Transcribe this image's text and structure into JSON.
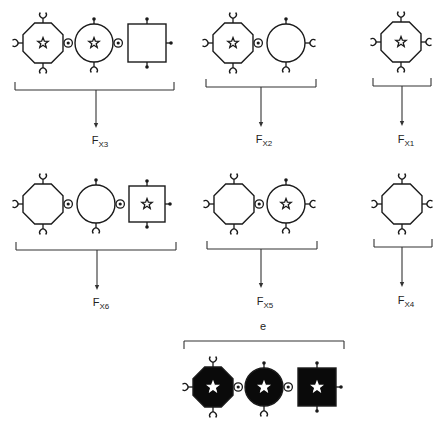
{
  "colors": {
    "stroke": "#1a1a1a",
    "fill_dark": "#0a0a0a",
    "star_light": "#ffffff",
    "background": "#ffffff"
  },
  "groups": [
    {
      "id": "x3",
      "label_main": "F",
      "label_sub": "X3",
      "bracket": {
        "x1": 15,
        "x2": 174,
        "y": 90,
        "arrow_x": 96,
        "arrow_y2": 128
      },
      "label_pos": {
        "x": 100,
        "y": 134
      },
      "shapes": [
        {
          "type": "octagon",
          "cx": 43,
          "cy": 43,
          "r": 20,
          "star": true,
          "filled": false,
          "ports": {
            "top": "cup",
            "bottom": "cup",
            "left": "cup",
            "right": "socket"
          }
        },
        {
          "type": "circle",
          "cx": 94,
          "cy": 43,
          "r": 19,
          "star": true,
          "filled": false,
          "ports": {
            "top": "dot",
            "bottom": "cup",
            "right": "socket"
          }
        },
        {
          "type": "square",
          "cx": 147,
          "cy": 43,
          "r": 19,
          "star": false,
          "filled": false,
          "ports": {
            "top": "dot",
            "bottom": "dot",
            "right": "dot"
          }
        }
      ]
    },
    {
      "id": "x2",
      "label_main": "F",
      "label_sub": "X2",
      "bracket": {
        "x1": 206,
        "x2": 316,
        "y": 87,
        "arrow_x": 261,
        "arrow_y2": 127
      },
      "label_pos": {
        "x": 264,
        "y": 133
      },
      "shapes": [
        {
          "type": "octagon",
          "cx": 233,
          "cy": 43,
          "r": 20,
          "star": true,
          "filled": false,
          "ports": {
            "top": "cup",
            "bottom": "cup",
            "left": "cup",
            "right": "socket"
          }
        },
        {
          "type": "circle",
          "cx": 286,
          "cy": 43,
          "r": 19,
          "star": false,
          "filled": false,
          "ports": {
            "top": "dot",
            "bottom": "cup",
            "right": "cup"
          }
        }
      ]
    },
    {
      "id": "x1",
      "label_main": "F",
      "label_sub": "X1",
      "bracket": {
        "x1": 373,
        "x2": 431,
        "y": 86,
        "arrow_x": 402,
        "arrow_y2": 126
      },
      "label_pos": {
        "x": 406,
        "y": 133
      },
      "shapes": [
        {
          "type": "octagon",
          "cx": 401,
          "cy": 42,
          "r": 20,
          "star": true,
          "filled": false,
          "ports": {
            "top": "cup",
            "bottom": "cup",
            "left": "cup",
            "right": "cup"
          }
        }
      ]
    },
    {
      "id": "x6",
      "label_main": "F",
      "label_sub": "X6",
      "bracket": {
        "x1": 16,
        "x2": 176,
        "y": 250,
        "arrow_x": 97,
        "arrow_y2": 290
      },
      "label_pos": {
        "x": 101,
        "y": 296
      },
      "shapes": [
        {
          "type": "octagon",
          "cx": 43,
          "cy": 204,
          "r": 20,
          "star": false,
          "filled": false,
          "ports": {
            "top": "cup",
            "bottom": "cup",
            "left": "cup",
            "right": "socket"
          }
        },
        {
          "type": "circle",
          "cx": 96,
          "cy": 204,
          "r": 19,
          "star": false,
          "filled": false,
          "ports": {
            "top": "dot",
            "bottom": "cup",
            "right": "socket"
          }
        },
        {
          "type": "square",
          "cx": 147,
          "cy": 204,
          "r": 18,
          "star": true,
          "filled": false,
          "ports": {
            "top": "dot",
            "bottom": "dot",
            "right": "dot"
          }
        }
      ]
    },
    {
      "id": "x5",
      "label_main": "F",
      "label_sub": "X5",
      "bracket": {
        "x1": 207,
        "x2": 317,
        "y": 249,
        "arrow_x": 261,
        "arrow_y2": 288
      },
      "label_pos": {
        "x": 265,
        "y": 295
      },
      "shapes": [
        {
          "type": "octagon",
          "cx": 234,
          "cy": 204,
          "r": 20,
          "star": false,
          "filled": false,
          "ports": {
            "top": "cup",
            "bottom": "cup",
            "left": "cup",
            "right": "socket"
          }
        },
        {
          "type": "circle",
          "cx": 286,
          "cy": 204,
          "r": 19,
          "star": true,
          "filled": false,
          "ports": {
            "top": "dot",
            "bottom": "cup",
            "right": "cup"
          }
        }
      ]
    },
    {
      "id": "x4",
      "label_main": "F",
      "label_sub": "X4",
      "bracket": {
        "x1": 374,
        "x2": 432,
        "y": 247,
        "arrow_x": 402,
        "arrow_y2": 287
      },
      "label_pos": {
        "x": 406,
        "y": 294
      },
      "shapes": [
        {
          "type": "octagon",
          "cx": 402,
          "cy": 204,
          "r": 20,
          "star": false,
          "filled": false,
          "ports": {
            "top": "cup",
            "bottom": "cup",
            "left": "cup",
            "right": "cup"
          }
        }
      ]
    }
  ],
  "e_group": {
    "label": "e",
    "label_pos": {
      "x": 263,
      "y": 320
    },
    "bracket": {
      "x1": 184,
      "x2": 344,
      "y": 341
    },
    "shapes": [
      {
        "type": "octagon",
        "cx": 213,
        "cy": 387,
        "r": 20,
        "star": true,
        "filled": true,
        "ports": {
          "top": "cup",
          "bottom": "cup",
          "left": "cup",
          "right": "socket"
        }
      },
      {
        "type": "circle",
        "cx": 264,
        "cy": 387,
        "r": 19,
        "star": true,
        "filled": true,
        "ports": {
          "top": "dot",
          "bottom": "cup",
          "right": "socket"
        }
      },
      {
        "type": "square",
        "cx": 317,
        "cy": 387,
        "r": 19,
        "star": true,
        "filled": true,
        "ports": {
          "top": "dot",
          "bottom": "dot",
          "right": "dot"
        }
      }
    ]
  }
}
